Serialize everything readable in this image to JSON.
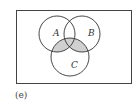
{
  "figure": {
    "caption": "(e)",
    "universe_rect": {
      "x": 16,
      "y": 10,
      "w": 115,
      "h": 73
    },
    "sets": [
      {
        "label": "A",
        "cx": 57,
        "cy": 34,
        "r": 18
      },
      {
        "label": "B",
        "cx": 82,
        "cy": 34,
        "r": 18
      },
      {
        "label": "C",
        "cx": 70,
        "cy": 57,
        "r": 19
      }
    ],
    "shaded_region": "C ∩ (A ∪ B)",
    "colors": {
      "stroke": "#333333",
      "shade": "#d0d0d0",
      "background": "#ffffff"
    }
  }
}
